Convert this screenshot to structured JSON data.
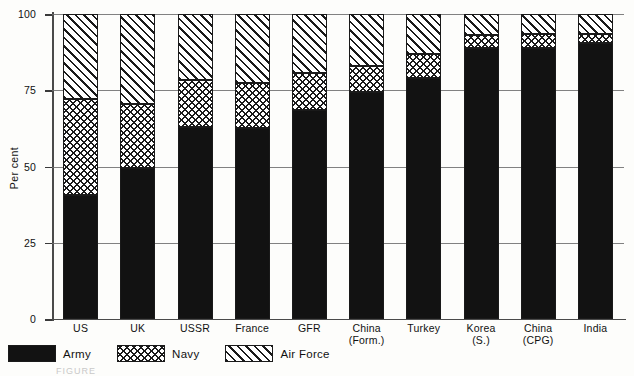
{
  "chart_data": {
    "type": "bar",
    "subtype": "stacked-bar-100-percent",
    "title": "",
    "xlabel": "",
    "ylabel": "Per cent",
    "ylim": [
      0,
      100
    ],
    "yticks": [
      0,
      25,
      50,
      75,
      100
    ],
    "ytick_labels": [
      "0",
      "25",
      "50",
      "75",
      "100"
    ],
    "grid": true,
    "grid_axis": "y",
    "legend_position": "below-left",
    "categories": [
      "US",
      "UK",
      "USSR",
      "France",
      "GFR",
      "China\n(Form.)",
      "Turkey",
      "Korea\n(S.)",
      "China\n(CPG)",
      "India"
    ],
    "category_labels": [
      {
        "line1": "US",
        "line2": ""
      },
      {
        "line1": "UK",
        "line2": ""
      },
      {
        "line1": "USSR",
        "line2": ""
      },
      {
        "line1": "France",
        "line2": ""
      },
      {
        "line1": "GFR",
        "line2": ""
      },
      {
        "line1": "China",
        "line2": "(Form.)"
      },
      {
        "line1": "Turkey",
        "line2": ""
      },
      {
        "line1": "Korea",
        "line2": "(S.)"
      },
      {
        "line1": "China",
        "line2": "(CPG)"
      },
      {
        "line1": "India",
        "line2": ""
      }
    ],
    "series": [
      {
        "name": "Army",
        "pattern": "solid-black",
        "color": "#121212",
        "values": [
          40.5,
          49.5,
          63.0,
          62.5,
          68.5,
          74.5,
          79.0,
          89.0,
          89.0,
          90.5
        ]
      },
      {
        "name": "Navy",
        "pattern": "cross-hatch",
        "color": "#ffffff",
        "values": [
          31.5,
          21.0,
          15.5,
          15.0,
          12.0,
          8.5,
          8.0,
          4.0,
          4.5,
          3.0
        ]
      },
      {
        "name": "Air Force",
        "pattern": "diagonal-hatch",
        "color": "#ffffff",
        "values": [
          28.0,
          29.5,
          21.5,
          22.5,
          19.5,
          17.0,
          13.0,
          7.0,
          6.5,
          6.5
        ]
      }
    ],
    "cumulative_tops": {
      "army": [
        40.5,
        49.5,
        63.0,
        62.5,
        68.5,
        74.5,
        79.0,
        89.0,
        89.0,
        90.5
      ],
      "navy": [
        72.0,
        70.5,
        78.5,
        77.5,
        80.5,
        83.0,
        87.0,
        93.0,
        93.5,
        93.5
      ],
      "air": [
        100,
        100,
        100,
        100,
        100,
        100,
        100,
        100,
        100,
        100
      ]
    }
  },
  "legend": {
    "items": [
      {
        "label": "Army",
        "swatch": "solid-black-swatch"
      },
      {
        "label": "Navy",
        "swatch": "cross-hatch-swatch"
      },
      {
        "label": "Air Force",
        "swatch": "diagonal-hatch-swatch"
      }
    ]
  },
  "caption": {
    "text": "FIGURE"
  },
  "colors": {
    "ink": "#121212",
    "axis": "#4a4a4a",
    "grid": "#6b6b6b",
    "background": "#fdfdfb"
  }
}
